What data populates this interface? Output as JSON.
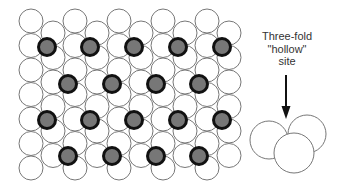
{
  "diagram": {
    "colors": {
      "background": "#ffffff",
      "substrate_fill": "#ffffff",
      "substrate_stroke": "#777777",
      "adsorbate_fill": "#777777",
      "adsorbate_stroke": "#111111",
      "arrow": "#111111",
      "text": "#333333"
    },
    "substrate_lattice": {
      "atom_radius": 12,
      "columns": [
        {
          "x": 31,
          "y_start": 21,
          "count": 7
        },
        {
          "x": 53,
          "y_start": 33,
          "count": 6
        },
        {
          "x": 75,
          "y_start": 21,
          "count": 7
        },
        {
          "x": 97,
          "y_start": 33,
          "count": 6
        },
        {
          "x": 119,
          "y_start": 21,
          "count": 7
        },
        {
          "x": 141,
          "y_start": 33,
          "count": 6
        },
        {
          "x": 163,
          "y_start": 21,
          "count": 7
        },
        {
          "x": 185,
          "y_start": 33,
          "count": 6
        },
        {
          "x": 207,
          "y_start": 21,
          "count": 7
        },
        {
          "x": 229,
          "y_start": 33,
          "count": 6
        }
      ],
      "row_spacing": 24.5
    },
    "adsorbates": {
      "radius": 8.5,
      "stroke_width": 3,
      "positions": [
        [
          47,
          47
        ],
        [
          90,
          47
        ],
        [
          134,
          47
        ],
        [
          178,
          47
        ],
        [
          222,
          47
        ],
        [
          68,
          84
        ],
        [
          112,
          84
        ],
        [
          156,
          84
        ],
        [
          199,
          84
        ],
        [
          47,
          120
        ],
        [
          90,
          120
        ],
        [
          134,
          120
        ],
        [
          178,
          120
        ],
        [
          222,
          120
        ],
        [
          68,
          156
        ],
        [
          112,
          156
        ],
        [
          156,
          156
        ],
        [
          199,
          156
        ]
      ]
    },
    "label": {
      "lines": [
        "Three-fold",
        "\"hollow\"",
        "site"
      ]
    },
    "arrow": {
      "x": 286,
      "y_start": 75,
      "y_end": 119
    },
    "hollow_site_inset": {
      "atoms": [
        {
          "name": "back-left",
          "cx": 269,
          "cy": 140,
          "r": 19
        },
        {
          "name": "back-right",
          "cx": 307,
          "cy": 134,
          "r": 19
        },
        {
          "name": "front",
          "cx": 294,
          "cy": 153,
          "r": 20
        }
      ]
    }
  }
}
